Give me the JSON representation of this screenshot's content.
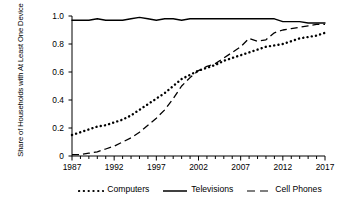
{
  "chart_data": {
    "type": "line",
    "title": "",
    "xlabel": "",
    "ylabel": "Share of Households with At Least One Device",
    "xlim": [
      1987,
      2017
    ],
    "ylim": [
      0,
      1.0
    ],
    "grid": false,
    "legend_position": "bottom",
    "x": [
      1987,
      1988,
      1989,
      1990,
      1991,
      1992,
      1993,
      1994,
      1995,
      1996,
      1997,
      1998,
      1999,
      2000,
      2001,
      2002,
      2003,
      2004,
      2005,
      2006,
      2007,
      2008,
      2009,
      2010,
      2011,
      2012,
      2013,
      2014,
      2015,
      2016,
      2017
    ],
    "xticks": [
      1987,
      1992,
      1997,
      2002,
      2007,
      2012,
      2017
    ],
    "xtick_labels": [
      "1987",
      "1992",
      "1997",
      "2002",
      "2007",
      "2012",
      "2017"
    ],
    "yticks": [
      0,
      0.2,
      0.4,
      0.6,
      0.8,
      1.0
    ],
    "ytick_labels": [
      "0",
      "0.2",
      "0.4",
      "0.6",
      "0.8",
      "1.0"
    ],
    "series": [
      {
        "name": "Computers",
        "style": "dotted",
        "color": "#000000",
        "values": [
          0.15,
          0.17,
          0.19,
          0.21,
          0.22,
          0.24,
          0.26,
          0.29,
          0.33,
          0.37,
          0.41,
          0.45,
          0.5,
          0.55,
          0.58,
          0.61,
          0.63,
          0.65,
          0.68,
          0.7,
          0.72,
          0.74,
          0.76,
          0.78,
          0.79,
          0.8,
          0.82,
          0.84,
          0.85,
          0.86,
          0.88
        ]
      },
      {
        "name": "Televisions",
        "style": "solid",
        "color": "#000000",
        "values": [
          0.97,
          0.97,
          0.97,
          0.98,
          0.97,
          0.97,
          0.97,
          0.98,
          0.99,
          0.98,
          0.97,
          0.98,
          0.98,
          0.97,
          0.98,
          0.98,
          0.98,
          0.98,
          0.98,
          0.98,
          0.98,
          0.98,
          0.98,
          0.98,
          0.98,
          0.96,
          0.96,
          0.96,
          0.95,
          0.95,
          0.95
        ]
      },
      {
        "name": "Cell Phones",
        "style": "dashed",
        "color": "#000000",
        "values": [
          0.01,
          0.01,
          0.02,
          0.03,
          0.05,
          0.07,
          0.1,
          0.13,
          0.17,
          0.22,
          0.27,
          0.33,
          0.41,
          0.5,
          0.56,
          0.61,
          0.64,
          0.66,
          0.7,
          0.74,
          0.78,
          0.84,
          0.82,
          0.83,
          0.88,
          0.9,
          0.91,
          0.92,
          0.93,
          0.94,
          0.94
        ]
      }
    ]
  },
  "legend": {
    "items": [
      {
        "label": "Computers",
        "style": "dotted"
      },
      {
        "label": "Televisions",
        "style": "solid"
      },
      {
        "label": "Cell Phones",
        "style": "dashed"
      }
    ]
  }
}
